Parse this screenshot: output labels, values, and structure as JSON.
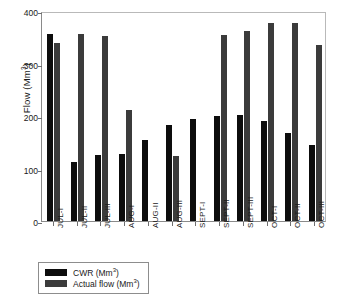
{
  "chart_data": {
    "type": "bar",
    "title": "",
    "xlabel": "",
    "ylabel": "Flow (Mm3)",
    "ylabel_base": "Flow (Mm",
    "ylabel_exponent": "3",
    "ylabel_close": ")",
    "ylim": [
      0,
      400
    ],
    "yticks": [
      0,
      100,
      200,
      300,
      400
    ],
    "grid": false,
    "legend_position": "below-axes-left",
    "categories": [
      "JUL-I",
      "JUL-II",
      "JUL-III",
      "AUG-I",
      "AUG-II",
      "AUG-III",
      "SEPT-I",
      "SEPT-II",
      "SEPT-III",
      "OCT-I",
      "OCT-II",
      "OCT-III"
    ],
    "series": [
      {
        "name": "CWR (Mm3)",
        "label_base": "CWR (Mm",
        "label_exponent": "3",
        "label_close": ")",
        "color": "#0d0d0d",
        "values": [
          357,
          113,
          125,
          128,
          154,
          182,
          194,
          200,
          201,
          190,
          167,
          144
        ]
      },
      {
        "name": "Actual flow (Mm3)",
        "label_base": "Actual flow (Mm",
        "label_exponent": "3",
        "label_close": ")",
        "color": "#3b3b3b",
        "values": [
          340,
          356,
          353,
          212,
          0,
          123,
          0,
          355,
          362,
          378,
          378,
          336
        ]
      }
    ]
  }
}
